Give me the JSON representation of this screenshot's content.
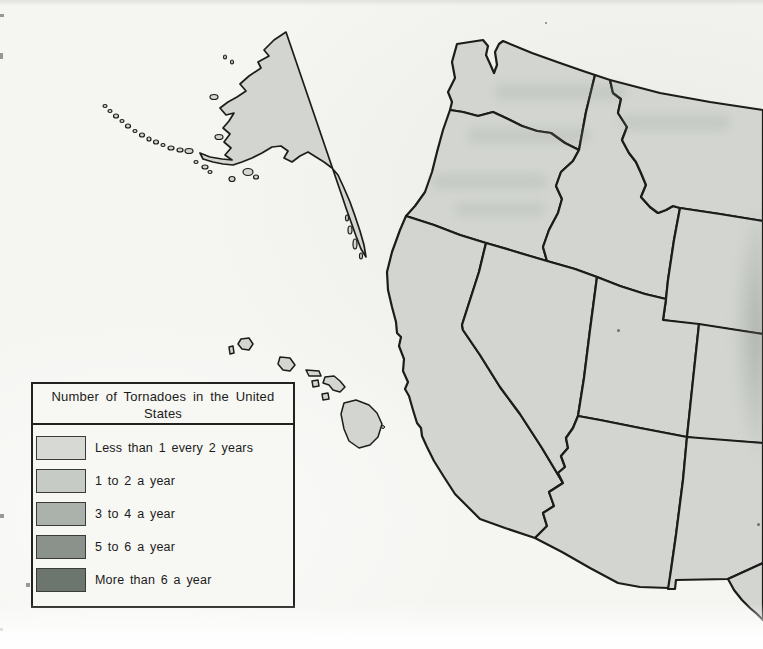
{
  "legend": {
    "title_line1": "Number of Tornadoes in the United",
    "title_line2": "States",
    "items": [
      {
        "label": "Less than 1 every 2 years",
        "color": "#d7dad4"
      },
      {
        "label": "1 to 2 a year",
        "color": "#c6cbc5"
      },
      {
        "label": "3 to 4 a year",
        "color": "#abb1ab"
      },
      {
        "label": "5 to 6 a year",
        "color": "#8a928b"
      },
      {
        "label": "More than 6 a year",
        "color": "#6d766e"
      }
    ]
  },
  "map": {
    "state_fill": "#d2d5d0",
    "border_color": "#1c1c1a",
    "visible_states": [
      "Washington",
      "Oregon",
      "Idaho",
      "Montana",
      "Wyoming",
      "California",
      "Nevada",
      "Utah",
      "Colorado",
      "Arizona",
      "New Mexico",
      "Texas",
      "Alaska",
      "Hawaii"
    ]
  }
}
